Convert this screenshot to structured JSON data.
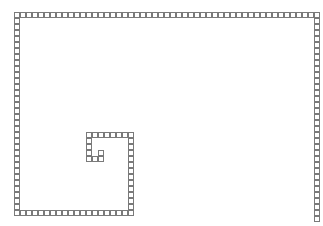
{
  "diagram": {
    "type": "square-spiral-grid",
    "origin": {
      "x": 14,
      "y": 12
    },
    "cell_size": 6,
    "cell_border_color": "#7a7a7a",
    "cell_fill_color": "#ffffff",
    "segments": [
      {
        "name": "outer-top-row",
        "orientation": "row",
        "row": 0,
        "from": 0,
        "to": 50
      },
      {
        "name": "outer-right-column",
        "orientation": "col",
        "col": 50,
        "from": 0,
        "to": 34
      },
      {
        "name": "outer-left-column",
        "orientation": "col",
        "col": 0,
        "from": 0,
        "to": 33
      },
      {
        "name": "outer-bottom-row",
        "orientation": "row",
        "row": 33,
        "from": 0,
        "to": 19
      },
      {
        "name": "inner-right-column",
        "orientation": "col",
        "col": 19,
        "from": 20,
        "to": 33
      },
      {
        "name": "inner-top-row",
        "orientation": "row",
        "row": 20,
        "from": 12,
        "to": 19
      },
      {
        "name": "inner-left-column",
        "orientation": "col",
        "col": 12,
        "from": 20,
        "to": 24
      },
      {
        "name": "inner-bottom-row",
        "orientation": "row",
        "row": 24,
        "from": 12,
        "to": 14
      },
      {
        "name": "center-stub",
        "orientation": "col",
        "col": 14,
        "from": 23,
        "to": 24
      }
    ]
  }
}
